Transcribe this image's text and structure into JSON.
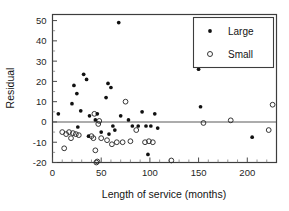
{
  "chart_data": {
    "type": "scatter",
    "title": "",
    "xlabel": "Length of service (months)",
    "ylabel": "Residual",
    "xlim": [
      0,
      230
    ],
    "ylim": [
      -20,
      53
    ],
    "xticks": [
      0,
      50,
      100,
      150,
      200
    ],
    "yticks": [
      -20,
      -10,
      0,
      10,
      20,
      30,
      40,
      50
    ],
    "grid": false,
    "reference_line": {
      "y": 0,
      "orientation": "horizontal"
    },
    "legend": {
      "position": "top-right",
      "entries": [
        {
          "name": "Large",
          "marker": "filled-circle"
        },
        {
          "name": "Small",
          "marker": "open-circle"
        }
      ]
    },
    "series": [
      {
        "name": "Large",
        "marker": "filled-circle",
        "points": [
          [
            6,
            4
          ],
          [
            20,
            9
          ],
          [
            22,
            18
          ],
          [
            25,
            14
          ],
          [
            29,
            5.5
          ],
          [
            32,
            23.5
          ],
          [
            35,
            21
          ],
          [
            38,
            3
          ],
          [
            44,
            1
          ],
          [
            46,
            4
          ],
          [
            55,
            12
          ],
          [
            57,
            19
          ],
          [
            60,
            17
          ],
          [
            62,
            -2
          ],
          [
            68,
            49
          ],
          [
            70,
            3
          ],
          [
            78,
            1
          ],
          [
            82,
            -2
          ],
          [
            92,
            5
          ],
          [
            96,
            -2
          ],
          [
            98,
            -16
          ],
          [
            101,
            -2
          ],
          [
            105,
            4
          ],
          [
            108,
            -3
          ],
          [
            150,
            26
          ],
          [
            152,
            7.5
          ],
          [
            205,
            -7.5
          ],
          [
            26,
            -2.5
          ],
          [
            37,
            -7
          ],
          [
            50,
            -5
          ],
          [
            58,
            -6
          ],
          [
            64,
            -4
          ],
          [
            88,
            -2
          ]
        ]
      },
      {
        "name": "Small",
        "marker": "open-circle",
        "points": [
          [
            10,
            -5
          ],
          [
            12,
            -13
          ],
          [
            14,
            -6
          ],
          [
            17,
            -5
          ],
          [
            19,
            -8
          ],
          [
            21,
            -5.5
          ],
          [
            24,
            -6
          ],
          [
            27,
            -6.5
          ],
          [
            40,
            -7
          ],
          [
            42,
            -8
          ],
          [
            43,
            4
          ],
          [
            44,
            -14
          ],
          [
            45,
            -20
          ],
          [
            46,
            -19.5
          ],
          [
            47,
            -1
          ],
          [
            48,
            0.5
          ],
          [
            50,
            -8
          ],
          [
            56,
            -9
          ],
          [
            61,
            -11
          ],
          [
            66,
            -10
          ],
          [
            72,
            -10
          ],
          [
            75,
            10
          ],
          [
            80,
            -9.5
          ],
          [
            86,
            -4
          ],
          [
            95,
            -10
          ],
          [
            99,
            -9.5
          ],
          [
            103,
            -10
          ],
          [
            122,
            -19
          ],
          [
            155,
            -0.5
          ],
          [
            183,
            0.8
          ],
          [
            222,
            -4
          ],
          [
            226,
            8.5
          ]
        ]
      }
    ]
  }
}
